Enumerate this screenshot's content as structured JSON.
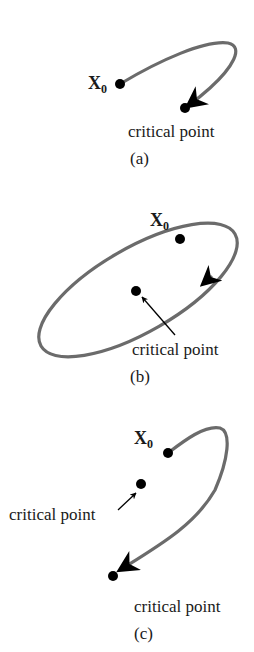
{
  "colors": {
    "trajectory": "#6b6b6b",
    "point": "#000000",
    "text": "#1a1a1a"
  },
  "panels": [
    {
      "caption": "(a)",
      "start_label": "X",
      "start_sub": "0",
      "critical_label": "critical point",
      "description": "trajectory from X0 spirals into critical point"
    },
    {
      "caption": "(b)",
      "start_label": "X",
      "start_sub": "0",
      "critical_label": "critical point",
      "description": "closed elliptical orbit around critical point"
    },
    {
      "caption": "(c)",
      "start_label": "X",
      "start_sub": "0",
      "critical_label_1": "critical point",
      "critical_label_2": "critical point",
      "description": "trajectory from X0 goes to a different critical point"
    }
  ]
}
